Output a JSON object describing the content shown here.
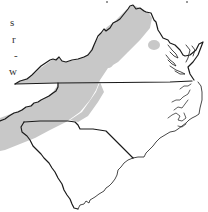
{
  "page": {
    "caption_fragments": [
      {
        "text": "s",
        "x": 10,
        "y": 17
      },
      {
        "text": "r",
        "x": 12,
        "y": 34
      },
      {
        "text": "-",
        "x": 14,
        "y": 50
      },
      {
        "text": "w",
        "x": 9,
        "y": 66
      }
    ]
  },
  "map": {
    "title": "",
    "regions": [
      "Virginia",
      "North Carolina",
      "South Carolina"
    ],
    "range_fill_color": "#c8c8c8",
    "outline_color": "#1a1a1a",
    "background_color": "#ffffff",
    "legend": "shaded area = distribution range"
  }
}
